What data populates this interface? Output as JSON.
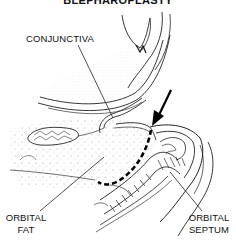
{
  "figure": {
    "title": "BLEPHAROPLASTY",
    "labels": {
      "conjunctiva": "CONJUNCTIVA",
      "orbital_fat_line1": "ORBITAL",
      "orbital_fat_line2": "FAT",
      "orbital_septum_line1": "ORBITAL",
      "orbital_septum_line2": "SEPTUM"
    },
    "colors": {
      "ink": "#111111",
      "stipple": "#9a9a9a",
      "background": "#ffffff"
    }
  }
}
